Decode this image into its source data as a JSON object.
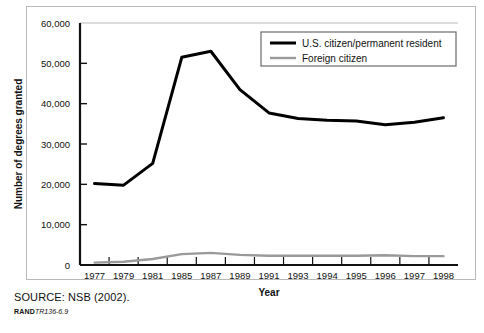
{
  "figure": {
    "source_note": "SOURCE: NSB (2002).",
    "rand_word": "RAND",
    "rand_doc": "TR136-6.9"
  },
  "chart_data": {
    "type": "line",
    "title": "",
    "xlabel": "Year",
    "ylabel": "Number of degrees granted",
    "categories": [
      "1977",
      "1979",
      "1981",
      "1985",
      "1987",
      "1989",
      "1991",
      "1993",
      "1994",
      "1995",
      "1996",
      "1997",
      "1998"
    ],
    "ylim": [
      0,
      60000
    ],
    "yticks": [
      0,
      10000,
      20000,
      30000,
      40000,
      50000,
      60000
    ],
    "ytick_labels": [
      "0",
      "10,000",
      "20,000",
      "30,000",
      "40,000",
      "50,000",
      "60,000"
    ],
    "grid": false,
    "legend_position": "top-right",
    "series": [
      {
        "name": "U.S. citizen/permanent resident",
        "color": "#000000",
        "width": 3,
        "values": [
          20200,
          19800,
          25200,
          51500,
          53000,
          43500,
          37700,
          36300,
          35900,
          35700,
          34800,
          35400,
          36500
        ]
      },
      {
        "name": "Foreign citizen",
        "color": "#9a9a9a",
        "width": 2.4,
        "values": [
          600,
          800,
          1500,
          2700,
          3000,
          2500,
          2300,
          2300,
          2300,
          2300,
          2400,
          2200,
          2200
        ]
      }
    ]
  }
}
